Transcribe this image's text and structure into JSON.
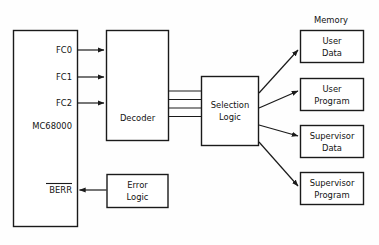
{
  "diagram": {
    "title_label": "Memory",
    "cpu": {
      "name": "MC68000",
      "signals": [
        {
          "id": "fc0",
          "label": "FC0"
        },
        {
          "id": "fc1",
          "label": "FC1"
        },
        {
          "id": "fc2",
          "label": "FC2"
        }
      ],
      "error_signal": {
        "id": "berr",
        "label": "BERR",
        "overlined": true
      }
    },
    "blocks": [
      {
        "id": "decoder",
        "label": "Decoder"
      },
      {
        "id": "selection-logic",
        "line1": "Selection",
        "line2": "Logic"
      },
      {
        "id": "error-logic",
        "line1": "Error",
        "line2": "Logic"
      }
    ],
    "memory_blocks": [
      {
        "id": "user-data",
        "line1": "User",
        "line2": "Data"
      },
      {
        "id": "user-program",
        "line1": "User",
        "line2": "Program"
      },
      {
        "id": "supervisor-data",
        "line1": "Supervisor",
        "line2": "Data"
      },
      {
        "id": "supervisor-program",
        "line1": "Supervisor",
        "line2": "Program"
      }
    ],
    "bus": {
      "line_count": 4,
      "from": "decoder",
      "to": "selection-logic"
    },
    "colors": {
      "stroke": "#1a1a1a",
      "text": "#121212",
      "background": "#fefefe",
      "box_fill": "#ffffff"
    }
  }
}
